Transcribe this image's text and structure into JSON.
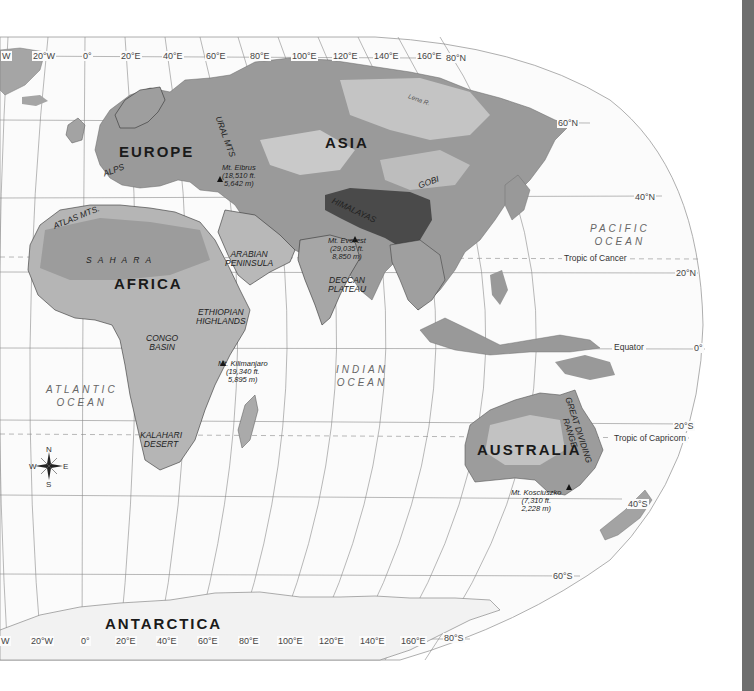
{
  "map": {
    "title": "Eastern Hemisphere Physical Map",
    "continents": [
      {
        "id": "europe",
        "label": "EUROPE"
      },
      {
        "id": "asia",
        "label": "ASIA"
      },
      {
        "id": "africa",
        "label": "AFRICA"
      },
      {
        "id": "australia",
        "label": "AUSTRALIA"
      },
      {
        "id": "antarctica",
        "label": "ANTARCTICA"
      }
    ],
    "oceans": [
      {
        "id": "pacific",
        "line1": "PACIFIC",
        "line2": "OCEAN"
      },
      {
        "id": "atlantic",
        "line1": "ATLANTIC",
        "line2": "OCEAN"
      },
      {
        "id": "indian",
        "line1": "INDIAN",
        "line2": "OCEAN"
      }
    ],
    "regions": {
      "alps": "ALPS",
      "ural": "URAL MTS",
      "gobi": "GOBI",
      "himalayas": "HIMALAYAS",
      "atlas": "ATLAS MTS.",
      "sahara": "S A H A R A",
      "arabian_1": "ARABIAN",
      "arabian_2": "PENINSULA",
      "deccan_1": "DECCAN",
      "deccan_2": "PLATEAU",
      "ethiopian_1": "ETHIOPIAN",
      "ethiopian_2": "HIGHLANDS",
      "congo_1": "CONGO",
      "congo_2": "BASIN",
      "kalahari_1": "KALAHARI",
      "kalahari_2": "DESERT",
      "great_dividing_1": "GREAT DIVIDING",
      "great_dividing_2": "RANGE",
      "lena": "Lena R."
    },
    "peaks": [
      {
        "id": "elbrus",
        "name": "Mt. Elbrus",
        "ft": "(18,510 ft.",
        "m": "5,642 m)"
      },
      {
        "id": "everest",
        "name": "Mt. Everest",
        "ft": "(29,035 ft.",
        "m": "8,850 m)"
      },
      {
        "id": "kilimanjaro",
        "name": "Mt. Kilimanjaro",
        "ft": "(19,340 ft.",
        "m": "5,895 m)"
      },
      {
        "id": "kosciuszko",
        "name": "Mt. Kosciuszko",
        "ft": "(7,310 ft.",
        "m": "2,228 m)"
      }
    ],
    "lines": {
      "tropic_cancer": "Tropic of Cancer",
      "tropic_capricorn": "Tropic of Capricorn",
      "equator": "Equator"
    },
    "latitudes": {
      "n80": "80°N",
      "n60": "60°N",
      "n40": "40°N",
      "n20": "20°N",
      "eq": "0°",
      "s20": "20°S",
      "s40": "40°S",
      "s60": "60°S",
      "s80": "80°S"
    },
    "longitudes_top": [
      "W",
      "20°W",
      "0°",
      "20°E",
      "40°E",
      "60°E",
      "80°E",
      "100°E",
      "120°E",
      "140°E",
      "160°E"
    ],
    "longitudes_bottom": [
      "W",
      "20°W",
      "0°",
      "20°E",
      "40°E",
      "60°E",
      "80°E",
      "100°E",
      "120°E",
      "140°E",
      "160°E"
    ],
    "compass": {
      "n": "N",
      "s": "S",
      "e": "E",
      "w": "W"
    }
  },
  "colors": {
    "land_low": "#8f8f8f",
    "land_mid": "#b4b4b4",
    "land_high": "#d2d2d2",
    "mountain": "#5a5a5a",
    "ocean": "#fbfbfb",
    "grid": "#8a8a8a",
    "border": "#222222",
    "sidebar": "#6e6e6e"
  }
}
